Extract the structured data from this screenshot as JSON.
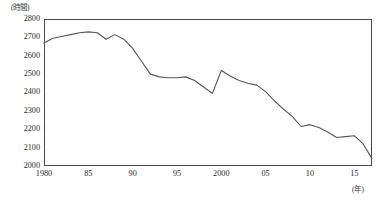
{
  "chart_data": {
    "type": "line",
    "title": "",
    "xlabel": "(年)",
    "ylabel": "(時間)",
    "unit_label_y": "(時間)",
    "unit_label_x": "(年)",
    "xlim": [
      1980,
      2017
    ],
    "ylim": [
      2000,
      2800
    ],
    "ytick_values": [
      2800,
      2700,
      2600,
      2500,
      2400,
      2300,
      2200,
      2100,
      2000
    ],
    "ytick_labels": [
      "2800",
      "2700",
      "2600",
      "2500",
      "2400",
      "2300",
      "2200",
      "2100",
      "2000"
    ],
    "xtick_values": [
      1980,
      1985,
      1990,
      1995,
      2000,
      2005,
      2010,
      2015
    ],
    "xtick_labels": [
      "1980",
      "85",
      "90",
      "95",
      "2000",
      "05",
      "10",
      "15"
    ],
    "grid": false,
    "legend": null,
    "series": [
      {
        "name": "年間総実労働時間",
        "color": "#555555",
        "x": [
          1980,
          1981,
          1982,
          1983,
          1984,
          1985,
          1986,
          1987,
          1988,
          1989,
          1990,
          1991,
          1992,
          1993,
          1994,
          1995,
          1996,
          1997,
          1998,
          1999,
          2000,
          2001,
          2002,
          2003,
          2004,
          2005,
          2006,
          2007,
          2008,
          2009,
          2010,
          2011,
          2012,
          2013,
          2014,
          2015,
          2016,
          2017
        ],
        "values": [
          2670,
          2695,
          2705,
          2715,
          2725,
          2730,
          2725,
          2690,
          2715,
          2690,
          2640,
          2570,
          2500,
          2485,
          2480,
          2480,
          2485,
          2465,
          2430,
          2395,
          2520,
          2490,
          2465,
          2450,
          2440,
          2405,
          2355,
          2310,
          2270,
          2215,
          2225,
          2210,
          2185,
          2155,
          2160,
          2165,
          2120,
          2040
        ]
      }
    ]
  }
}
